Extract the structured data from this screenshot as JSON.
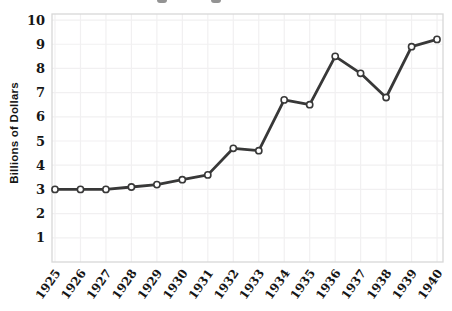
{
  "figure": {
    "title": "",
    "ylabel": "Billions of Dollars"
  },
  "chart_data": {
    "type": "line",
    "title": "",
    "xlabel": "",
    "ylabel": "Billions of Dollars",
    "x": [
      1925,
      1926,
      1927,
      1928,
      1929,
      1930,
      1931,
      1932,
      1933,
      1934,
      1935,
      1936,
      1937,
      1938,
      1939,
      1940
    ],
    "values": [
      3.0,
      3.0,
      3.0,
      3.1,
      3.2,
      3.4,
      3.6,
      4.7,
      4.6,
      6.7,
      6.5,
      8.5,
      7.8,
      6.8,
      8.9,
      9.2
    ],
    "ylim": [
      0,
      10.25
    ],
    "yticks": [
      1,
      2,
      3,
      4,
      5,
      6,
      7,
      8,
      9,
      10
    ],
    "grid": true,
    "legend": "none",
    "marker": "open-circle",
    "colors": {
      "line": "#383838",
      "marker_fill": "#ffffff",
      "grid": "#f1f0f1",
      "plot_border": "#d8d8d8",
      "text": "#161616"
    }
  }
}
